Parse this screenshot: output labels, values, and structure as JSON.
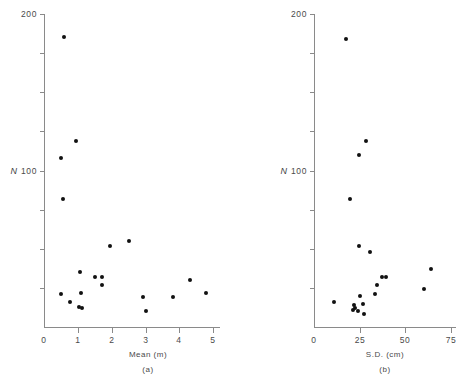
{
  "figure": {
    "caption_a": "(a)",
    "caption_b": "(b)"
  },
  "chart_data": [
    {
      "type": "scatter",
      "panel": "a",
      "title": "",
      "xlabel": "Mean (m)",
      "ylabel": "N",
      "xlim": [
        0,
        5.2
      ],
      "ylim": [
        0,
        200
      ],
      "xticks": [
        0,
        1,
        2,
        3,
        4,
        5
      ],
      "xtick_labels": [
        "0",
        "1",
        "2",
        "3",
        "4",
        "5"
      ],
      "yticks": [
        0,
        25,
        50,
        75,
        100,
        125,
        150,
        175,
        200
      ],
      "ytick_labels": [
        "",
        "",
        "",
        "",
        "100",
        "",
        "",
        "",
        "200"
      ],
      "grid": false,
      "legend": "none",
      "marker": "filled-circle",
      "marker_color": "#111111",
      "points": [
        {
          "x": 0.6,
          "y": 185
        },
        {
          "x": 0.95,
          "y": 119
        },
        {
          "x": 0.5,
          "y": 108
        },
        {
          "x": 0.55,
          "y": 82
        },
        {
          "x": 1.95,
          "y": 52
        },
        {
          "x": 2.5,
          "y": 55
        },
        {
          "x": 1.5,
          "y": 32
        },
        {
          "x": 1.72,
          "y": 32
        },
        {
          "x": 1.72,
          "y": 27
        },
        {
          "x": 1.05,
          "y": 35
        },
        {
          "x": 1.1,
          "y": 22
        },
        {
          "x": 0.5,
          "y": 21
        },
        {
          "x": 0.78,
          "y": 16
        },
        {
          "x": 1.02,
          "y": 13
        },
        {
          "x": 1.12,
          "y": 12
        },
        {
          "x": 2.92,
          "y": 19
        },
        {
          "x": 3.0,
          "y": 10
        },
        {
          "x": 3.82,
          "y": 19
        },
        {
          "x": 4.3,
          "y": 30
        },
        {
          "x": 4.78,
          "y": 22
        }
      ]
    },
    {
      "type": "scatter",
      "panel": "b",
      "title": "",
      "xlabel": "S.D. (cm)",
      "ylabel": "N",
      "xlim": [
        0,
        78
      ],
      "ylim": [
        0,
        200
      ],
      "xticks": [
        0,
        25,
        50,
        75
      ],
      "xtick_labels": [
        "0",
        "25",
        "50",
        "75"
      ],
      "yticks": [
        0,
        25,
        50,
        75,
        100,
        125,
        150,
        175,
        200
      ],
      "ytick_labels": [
        "",
        "",
        "",
        "",
        "100",
        "",
        "",
        "",
        "200"
      ],
      "grid": false,
      "legend": "none",
      "marker": "filled-circle",
      "marker_color": "#111111",
      "points": [
        {
          "x": 17.5,
          "y": 184
        },
        {
          "x": 28.5,
          "y": 119
        },
        {
          "x": 24.5,
          "y": 110
        },
        {
          "x": 20.0,
          "y": 82
        },
        {
          "x": 24.5,
          "y": 52
        },
        {
          "x": 30.5,
          "y": 48
        },
        {
          "x": 64.0,
          "y": 37
        },
        {
          "x": 37.5,
          "y": 32
        },
        {
          "x": 39.5,
          "y": 32
        },
        {
          "x": 34.5,
          "y": 27
        },
        {
          "x": 60.5,
          "y": 24
        },
        {
          "x": 33.5,
          "y": 21
        },
        {
          "x": 25.0,
          "y": 20
        },
        {
          "x": 11.0,
          "y": 16
        },
        {
          "x": 27.0,
          "y": 15
        },
        {
          "x": 22.0,
          "y": 14
        },
        {
          "x": 22.5,
          "y": 12
        },
        {
          "x": 21.5,
          "y": 11
        },
        {
          "x": 24.0,
          "y": 10
        },
        {
          "x": 27.5,
          "y": 8
        }
      ]
    }
  ]
}
